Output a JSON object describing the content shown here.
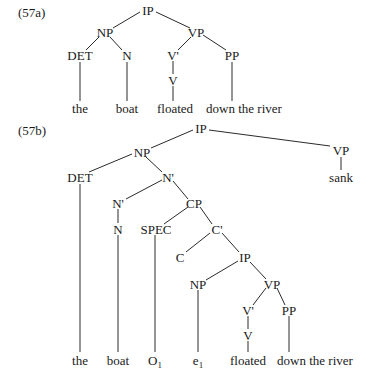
{
  "examples": [
    {
      "label": "(57a)",
      "nodes": [
        {
          "id": "a_ip",
          "text": "IP",
          "x": 148,
          "y": 10
        },
        {
          "id": "a_np",
          "text": "NP",
          "x": 105,
          "y": 32
        },
        {
          "id": "a_vp",
          "text": "VP",
          "x": 196,
          "y": 32
        },
        {
          "id": "a_det",
          "text": "DET",
          "x": 80,
          "y": 55
        },
        {
          "id": "a_n",
          "text": "N",
          "x": 127,
          "y": 55
        },
        {
          "id": "a_vbar",
          "text": "V'",
          "x": 173,
          "y": 55
        },
        {
          "id": "a_pp",
          "text": "PP",
          "x": 232,
          "y": 55
        },
        {
          "id": "a_v",
          "text": "V",
          "x": 173,
          "y": 80
        },
        {
          "id": "a_the",
          "text": "the",
          "x": 80,
          "y": 108
        },
        {
          "id": "a_boat",
          "text": "boat",
          "x": 127,
          "y": 108
        },
        {
          "id": "a_floated",
          "text": "floated",
          "x": 175,
          "y": 108
        },
        {
          "id": "a_down",
          "text": "down the river",
          "x": 244,
          "y": 108
        }
      ]
    },
    {
      "label": "(57b)",
      "nodes": [
        {
          "id": "b_ip",
          "text": "IP",
          "x": 201,
          "y": 128
        },
        {
          "id": "b_np",
          "text": "NP",
          "x": 142,
          "y": 152
        },
        {
          "id": "b_vp",
          "text": "VP",
          "x": 341,
          "y": 150
        },
        {
          "id": "b_sank",
          "text": "sank",
          "x": 341,
          "y": 177
        },
        {
          "id": "b_det",
          "text": "DET",
          "x": 80,
          "y": 177
        },
        {
          "id": "b_nbar1",
          "text": "N'",
          "x": 168,
          "y": 177
        },
        {
          "id": "b_nbar2",
          "text": "N'",
          "x": 118,
          "y": 203
        },
        {
          "id": "b_cp",
          "text": "CP",
          "x": 194,
          "y": 203
        },
        {
          "id": "b_n",
          "text": "N",
          "x": 118,
          "y": 229
        },
        {
          "id": "b_spec",
          "text": "SPEC",
          "x": 156,
          "y": 229
        },
        {
          "id": "b_cbar",
          "text": "C'",
          "x": 217,
          "y": 229
        },
        {
          "id": "b_c",
          "text": "C",
          "x": 180,
          "y": 257
        },
        {
          "id": "b_ip2",
          "text": "IP",
          "x": 245,
          "y": 257
        },
        {
          "id": "b_np2",
          "text": "NP",
          "x": 198,
          "y": 284
        },
        {
          "id": "b_vp2",
          "text": "VP",
          "x": 272,
          "y": 284
        },
        {
          "id": "b_vbar",
          "text": "V'",
          "x": 248,
          "y": 310
        },
        {
          "id": "b_pp",
          "text": "PP",
          "x": 289,
          "y": 310
        },
        {
          "id": "b_v",
          "text": "V",
          "x": 248,
          "y": 335
        },
        {
          "id": "b_the",
          "text": "the",
          "x": 80,
          "y": 360
        },
        {
          "id": "b_boat",
          "text": "boat",
          "x": 118,
          "y": 360
        },
        {
          "id": "b_o1",
          "text": "O",
          "sub": "1",
          "x": 155,
          "y": 360
        },
        {
          "id": "b_e1",
          "text": "e",
          "sub": "1",
          "x": 198,
          "y": 360
        },
        {
          "id": "b_floated",
          "text": "floated",
          "x": 248,
          "y": 360
        },
        {
          "id": "b_down",
          "text": "down the river",
          "x": 315,
          "y": 360
        }
      ]
    }
  ],
  "edges": [
    [
      140,
      12,
      113,
      28
    ],
    [
      156,
      12,
      190,
      28
    ],
    [
      99,
      37,
      86,
      50
    ],
    [
      110,
      37,
      122,
      50
    ],
    [
      191,
      37,
      178,
      50
    ],
    [
      203,
      35,
      226,
      50
    ],
    [
      173,
      61,
      173,
      74
    ],
    [
      80,
      62,
      80,
      101
    ],
    [
      127,
      62,
      127,
      101
    ],
    [
      173,
      86,
      173,
      101
    ],
    [
      232,
      62,
      232,
      101
    ],
    [
      193,
      130,
      151,
      148
    ],
    [
      209,
      130,
      330,
      146
    ],
    [
      341,
      157,
      341,
      170
    ],
    [
      132,
      154,
      89,
      172
    ],
    [
      146,
      157,
      162,
      172
    ],
    [
      162,
      180,
      126,
      199
    ],
    [
      173,
      181,
      188,
      199
    ],
    [
      188,
      207,
      164,
      224
    ],
    [
      200,
      207,
      212,
      224
    ],
    [
      118,
      209,
      118,
      223
    ],
    [
      210,
      233,
      186,
      252
    ],
    [
      222,
      233,
      239,
      252
    ],
    [
      238,
      261,
      206,
      280
    ],
    [
      250,
      262,
      266,
      279
    ],
    [
      266,
      288,
      253,
      305
    ],
    [
      277,
      288,
      285,
      305
    ],
    [
      248,
      316,
      248,
      329
    ],
    [
      80,
      184,
      80,
      352
    ],
    [
      118,
      235,
      118,
      352
    ],
    [
      155,
      235,
      155,
      352
    ],
    [
      198,
      290,
      198,
      352
    ],
    [
      248,
      341,
      248,
      352
    ],
    [
      289,
      316,
      289,
      352
    ]
  ]
}
